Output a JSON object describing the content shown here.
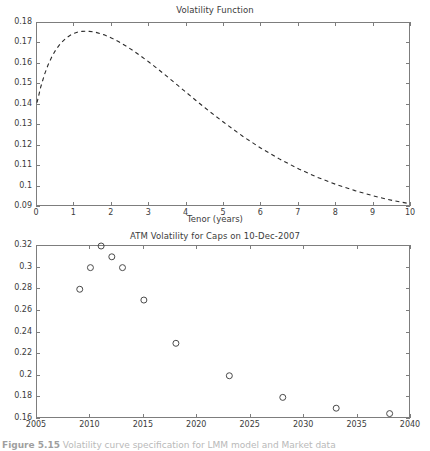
{
  "figure": {
    "caption_label": "Figure 5.15",
    "caption_text": "Volatility curve specification for LMM model and Market data",
    "background_color": "#ffffff",
    "axis_color": "#7d7d7d",
    "text_color": "#3b3b3b"
  },
  "chart_data": [
    {
      "id": "volatility-function",
      "type": "line",
      "title": "Volatility Function",
      "xlabel": "Tenor (years)",
      "ylabel": "",
      "xlim": [
        0,
        10
      ],
      "ylim": [
        0.09,
        0.18
      ],
      "grid": false,
      "legend": null,
      "line_style": "dashed",
      "line_color": "#2b2b2b",
      "xticks": [
        "0",
        "1",
        "2",
        "3",
        "4",
        "5",
        "6",
        "7",
        "8",
        "9",
        "10"
      ],
      "xtick_values": [
        0,
        1,
        2,
        3,
        4,
        5,
        6,
        7,
        8,
        9,
        10
      ],
      "yticks": [
        "0.09",
        "0.1",
        "0.11",
        "0.12",
        "0.13",
        "0.14",
        "0.15",
        "0.16",
        "0.17",
        "0.18"
      ],
      "ytick_values": [
        0.09,
        0.1,
        0.11,
        0.12,
        0.13,
        0.14,
        0.15,
        0.16,
        0.17,
        0.18
      ],
      "x": [
        0,
        0.1,
        0.2,
        0.3,
        0.4,
        0.5,
        0.6,
        0.7,
        0.8,
        0.9,
        1.0,
        1.1,
        1.2,
        1.3,
        1.4,
        1.5,
        1.6,
        1.8,
        2.0,
        2.2,
        2.4,
        2.6,
        2.8,
        3.0,
        3.25,
        3.5,
        3.75,
        4.0,
        4.25,
        4.5,
        4.75,
        5.0,
        5.5,
        6.0,
        6.5,
        7.0,
        7.5,
        8.0,
        8.5,
        9.0,
        9.5,
        10.0
      ],
      "y": [
        0.141,
        0.1487,
        0.1548,
        0.1597,
        0.1636,
        0.1668,
        0.1693,
        0.1713,
        0.1729,
        0.1741,
        0.175,
        0.1756,
        0.1759,
        0.176,
        0.1759,
        0.1757,
        0.1753,
        0.1742,
        0.1726,
        0.1707,
        0.1685,
        0.1661,
        0.1635,
        0.1608,
        0.1572,
        0.1535,
        0.1497,
        0.1459,
        0.1421,
        0.1384,
        0.1348,
        0.1313,
        0.1246,
        0.1186,
        0.1133,
        0.1086,
        0.1045,
        0.101,
        0.098,
        0.0954,
        0.0932,
        0.0915
      ]
    },
    {
      "id": "atm-volatility-caps",
      "type": "scatter",
      "title": "ATM Volatility for Caps on 10-Dec-2007",
      "xlabel": "",
      "ylabel": "",
      "xlim": [
        2005,
        2040
      ],
      "ylim": [
        0.16,
        0.32
      ],
      "grid": false,
      "legend": null,
      "marker": "open-circle",
      "marker_color": "#4a4a4a",
      "xticks": [
        "2005",
        "2010",
        "2015",
        "2020",
        "2025",
        "2030",
        "2035",
        "2040"
      ],
      "xtick_values": [
        2005,
        2010,
        2015,
        2020,
        2025,
        2030,
        2035,
        2040
      ],
      "yticks": [
        "0.16",
        "0.18",
        "0.2",
        "0.22",
        "0.24",
        "0.26",
        "0.28",
        "0.3",
        "0.32"
      ],
      "ytick_values": [
        0.16,
        0.18,
        0.2,
        0.22,
        0.24,
        0.26,
        0.28,
        0.3,
        0.32
      ],
      "points": [
        {
          "x": 2009,
          "y": 0.28
        },
        {
          "x": 2010,
          "y": 0.3
        },
        {
          "x": 2011,
          "y": 0.32
        },
        {
          "x": 2012,
          "y": 0.31
        },
        {
          "x": 2013,
          "y": 0.3
        },
        {
          "x": 2015,
          "y": 0.27
        },
        {
          "x": 2018,
          "y": 0.23
        },
        {
          "x": 2023,
          "y": 0.2
        },
        {
          "x": 2028,
          "y": 0.18
        },
        {
          "x": 2033,
          "y": 0.17
        },
        {
          "x": 2038,
          "y": 0.165
        }
      ]
    }
  ]
}
